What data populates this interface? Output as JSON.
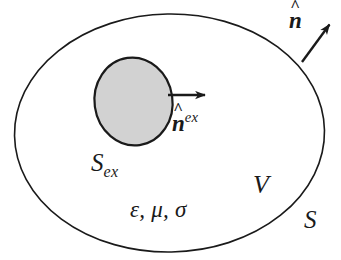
{
  "figure": {
    "width": 341,
    "height": 260,
    "background_color": "#ffffff",
    "stroke_color": "#1a1a1a",
    "inner_fill_color": "#d2d2d2"
  },
  "shapes": {
    "outer_boundary": {
      "name": "outer-ellipse",
      "cx": 169.5,
      "cy": 133,
      "rx": 155,
      "ry": 119,
      "rotation": -1,
      "fill": "none",
      "stroke": "#1a1a1a",
      "stroke_width": 1.6
    },
    "inner_region": {
      "name": "inner-ellipse",
      "cx": 133.5,
      "cy": 101.5,
      "rx": 39,
      "ry": 44,
      "rotation": -8,
      "fill": "#d2d2d2",
      "stroke": "#1a1a1a",
      "stroke_width": 2.2
    }
  },
  "arrows": {
    "outer_normal": {
      "name": "outer-normal-arrow",
      "x1": 302,
      "y1": 62,
      "x2": 332,
      "y2": 21,
      "stroke_width": 2.4
    },
    "excluded_normal": {
      "name": "excluded-normal-arrow",
      "x1": 168,
      "y1": 95,
      "x2": 208,
      "y2": 95,
      "stroke_width": 2.4
    }
  },
  "labels": {
    "outer_normal": {
      "symbol": "n",
      "accent": "^",
      "full_text": "n̂"
    },
    "excluded_normal": {
      "symbol": "n",
      "accent": "^",
      "superscript": "ex",
      "full_text": "n̂ex"
    },
    "excluded_surface": {
      "symbol": "S",
      "subscript": "ex",
      "full_text": "Sex"
    },
    "volume": {
      "symbol": "V",
      "full_text": "V"
    },
    "surface": {
      "symbol": "S",
      "full_text": "S"
    },
    "medium_parameters": {
      "epsilon": "ε",
      "mu": "μ",
      "sigma": "σ",
      "full_text": "ε, μ, σ"
    }
  }
}
